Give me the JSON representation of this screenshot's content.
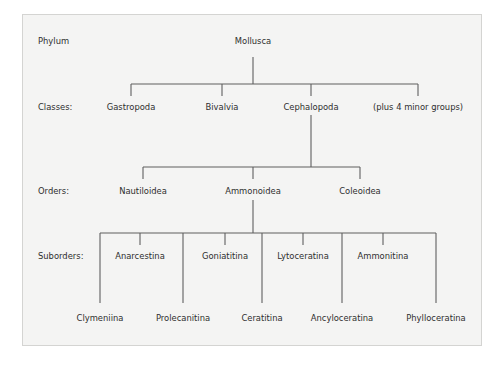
{
  "diagram": {
    "ranks": {
      "phylum": "Phylum",
      "classes": "Classes:",
      "orders": "Orders:",
      "suborders": "Suborders:"
    },
    "phylum": "Mollusca",
    "classes": [
      "Gastropoda",
      "Bivalvia",
      "Cephalopoda",
      "(plus 4 minor groups)"
    ],
    "orders": [
      "Nautiloidea",
      "Ammonoidea",
      "Coleoidea"
    ],
    "suborders_upper": [
      "Anarcestina",
      "Goniatitina",
      "Lytoceratina",
      "Ammonitina"
    ],
    "suborders_lower": [
      "Clymeniina",
      "Prolecanitina",
      "Ceratitina",
      "Ancyloceratina",
      "Phylloceratina"
    ],
    "line_color": "#5a5a5a",
    "background_color": "#f4f4f3"
  }
}
